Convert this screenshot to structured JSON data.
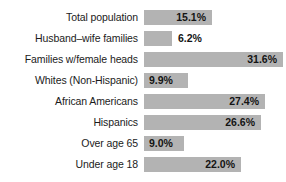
{
  "chart_data": {
    "type": "bar",
    "orientation": "horizontal",
    "title": "",
    "xlabel": "",
    "ylabel": "",
    "grid": false,
    "legend": null,
    "xlim": [
      0,
      32
    ],
    "value_suffix": "%",
    "categories": [
      "Total population",
      "Husband–wife families",
      "Families w/female heads",
      "Whites (Non-Hispanic)",
      "African Americans",
      "Hispanics",
      "Over age 65",
      "Under age 18"
    ],
    "values": [
      15.1,
      6.2,
      31.6,
      9.9,
      27.4,
      26.6,
      9.0,
      22.0
    ],
    "value_labels": [
      "15.1%",
      "6.2%",
      "31.6%",
      "9.9%",
      "27.4%",
      "26.6%",
      "9.0%",
      "22.0%"
    ],
    "bar_color": "#b3b3b3",
    "label_color": "#1b1b1b",
    "background": "#ffffff"
  },
  "rows": [
    {
      "label": "Total population",
      "value_label": "15.1%",
      "value": 15.1,
      "top": 10,
      "width": 68,
      "label_pos": "inside-right"
    },
    {
      "label": "Husband–wife families",
      "value_label": "6.2%",
      "value": 6.2,
      "top": 31,
      "width": 28,
      "label_pos": "outside"
    },
    {
      "label": "Families w/female heads",
      "value_label": "31.6%",
      "value": 31.6,
      "top": 52,
      "width": 139,
      "label_pos": "inside-right"
    },
    {
      "label": "Whites (Non-Hispanic)",
      "value_label": "9.9%",
      "value": 9.9,
      "top": 73,
      "width": 44,
      "label_pos": "inside-left"
    },
    {
      "label": "African Americans",
      "value_label": "27.4%",
      "value": 27.4,
      "top": 94,
      "width": 121,
      "label_pos": "inside-right"
    },
    {
      "label": "Hispanics",
      "value_label": "26.6%",
      "value": 26.6,
      "top": 115,
      "width": 117,
      "label_pos": "inside-right"
    },
    {
      "label": "Over age 65",
      "value_label": "9.0%",
      "value": 9.0,
      "top": 136,
      "width": 40,
      "label_pos": "inside-left"
    },
    {
      "label": "Under age 18",
      "value_label": "22.0%",
      "value": 22.0,
      "top": 157,
      "width": 97,
      "label_pos": "inside-right"
    }
  ]
}
